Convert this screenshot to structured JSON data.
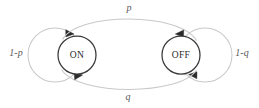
{
  "diagram": {
    "type": "state-machine",
    "canvas": {
      "width": 259,
      "height": 108,
      "background": "#ffffff"
    },
    "colors": {
      "node_stroke": "#3a3a3a",
      "node_fill": "#ffffff",
      "edge_stroke": "#c9c9c9",
      "arrow_fill": "#2b2b2b",
      "node_text": "#2b2b2b",
      "edge_text": "#5a5a5a"
    },
    "nodes": [
      {
        "id": "on",
        "label": "ON",
        "cx": 77,
        "cy": 55,
        "r": 19
      },
      {
        "id": "off",
        "label": "OFF",
        "cx": 181,
        "cy": 55,
        "r": 19
      }
    ],
    "edges": [
      {
        "id": "on-to-off",
        "label": "p",
        "from": "on",
        "to": "off",
        "label_x": 129,
        "label_y": 9,
        "kind": "arc-top"
      },
      {
        "id": "off-to-on",
        "label": "q",
        "from": "off",
        "to": "on",
        "label_x": 128,
        "label_y": 98,
        "kind": "arc-bottom"
      },
      {
        "id": "on-self",
        "label": "1-p",
        "from": "on",
        "to": "on",
        "label_x": 16,
        "label_y": 54,
        "kind": "self-loop-left"
      },
      {
        "id": "off-self",
        "label": "1-q",
        "from": "off",
        "to": "off",
        "label_x": 242,
        "label_y": 54,
        "kind": "self-loop-right"
      }
    ]
  }
}
